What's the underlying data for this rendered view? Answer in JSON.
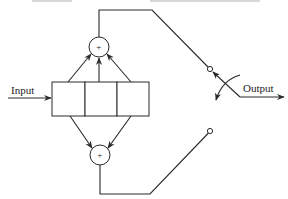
{
  "diagram": {
    "labels": {
      "input": "Input",
      "output": "Output",
      "sum_top": "+",
      "sum_bottom": "+"
    },
    "components": {
      "shift_register_cells": 3,
      "adders": 2,
      "switch": "commutator selecting between upper and lower adder outputs"
    },
    "colors": {
      "line": "#2a2a2a",
      "background": "#ffffff"
    }
  }
}
